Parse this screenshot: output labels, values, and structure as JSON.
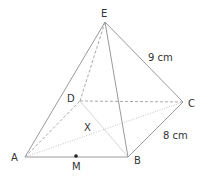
{
  "diagram": {
    "vertices": {
      "A": {
        "label": "A",
        "x": 25,
        "y": 157
      },
      "B": {
        "label": "B",
        "x": 128,
        "y": 157
      },
      "C": {
        "label": "C",
        "x": 183,
        "y": 102
      },
      "D": {
        "label": "D",
        "x": 80,
        "y": 101
      },
      "E": {
        "label": "E",
        "x": 105,
        "y": 22
      }
    },
    "points": {
      "M": {
        "label": "M",
        "x": 76,
        "y": 156
      },
      "X": {
        "label": "X"
      }
    },
    "measurements": {
      "EC": "9 cm",
      "BC": "8 cm"
    },
    "colors": {
      "edge": "#9a9a9a",
      "label": "#333333"
    }
  }
}
